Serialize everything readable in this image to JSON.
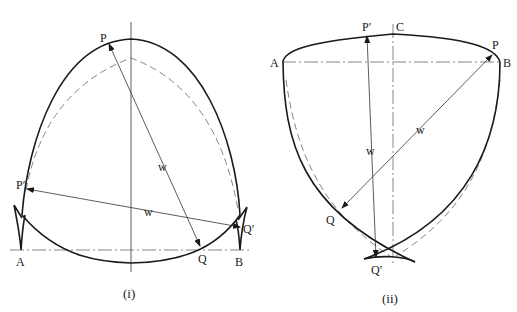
{
  "figure_i": {
    "caption": "(i)",
    "labels": {
      "P": "P",
      "P_prime": "P′",
      "Q": "Q",
      "Q_prime": "Q′",
      "A": "A",
      "B": "B",
      "w1": "w",
      "w2": "w"
    }
  },
  "figure_ii": {
    "caption": "(ii)",
    "labels": {
      "P": "P",
      "P_prime": "P′",
      "Q": "Q",
      "Q_prime": "Q′",
      "A": "A",
      "B": "B",
      "C": "C",
      "w1": "w",
      "w2": "w"
    }
  }
}
